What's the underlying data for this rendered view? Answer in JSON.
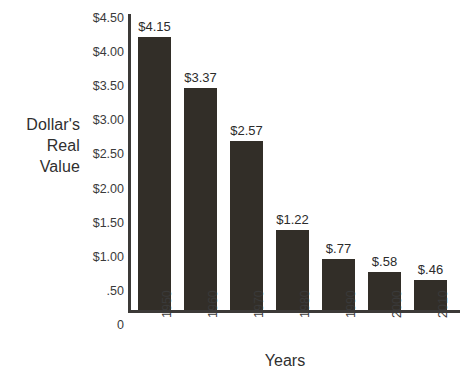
{
  "chart_data": {
    "type": "bar",
    "title": "",
    "xlabel": "Years",
    "ylabel": "Dollar's Real Value",
    "ylabel_lines": [
      "Dollar's",
      "Real",
      "Value"
    ],
    "categories": [
      "1950",
      "1960",
      "1970",
      "1980",
      "1990",
      "2000",
      "2010"
    ],
    "values": [
      4.15,
      3.37,
      2.57,
      1.22,
      0.77,
      0.58,
      0.46
    ],
    "value_labels": [
      "$4.15",
      "$3.37",
      "$2.57",
      "$1.22",
      "$.77",
      "$.58",
      "$.46"
    ],
    "ylim": [
      0,
      4.5
    ],
    "y_ticks": [
      4.5,
      4.0,
      3.5,
      3.0,
      2.5,
      2.0,
      1.5,
      1.0,
      0.5,
      0
    ],
    "y_tick_labels": [
      "$4.50",
      "$4.00",
      "$3.50",
      "$3.00",
      "$2.50",
      "$2.00",
      "$1.50",
      "$1.00",
      ".50",
      "0"
    ],
    "grid": false,
    "legend": "none",
    "bar_color": "#322e28",
    "axis_color": "#3c3a38",
    "text_color": "#2b2b2b"
  }
}
